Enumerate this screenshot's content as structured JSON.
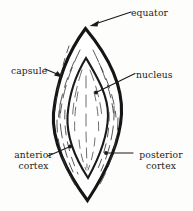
{
  "figure": {
    "background_color": "#fdfdfb",
    "ink_color": "#1a1a1a"
  },
  "labels": {
    "equator": "equator",
    "capsule": "capsule",
    "nucleus": "nucleus",
    "anterior_cortex_line1": "anterior",
    "anterior_cortex_line2": "cortex",
    "posterior_cortex_line1": "posterior",
    "posterior_cortex_line2": "cortex"
  },
  "structures": {
    "capsule_outline": "capsule-outline",
    "nucleus_outline": "nucleus-outline",
    "cortex_fibers": "cortex-fiber-lines",
    "nucleus_fibers": "nucleus-fiber-lines"
  },
  "leaders": {
    "equator": "arrow pointing down-left to the superior pole of the lens",
    "capsule": "arrow pointing down-right to the left capsule border",
    "nucleus": "line going down-left to the nucleus interior",
    "anterior_cortex": "line going up-right to a dot on the anterior cortex",
    "posterior_cortex": "line going left to a dot on the posterior cortex"
  }
}
